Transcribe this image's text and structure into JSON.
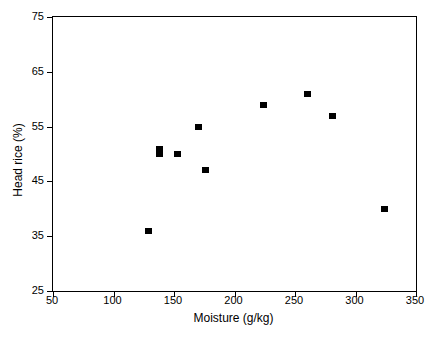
{
  "chart_data": {
    "type": "scatter",
    "title": "",
    "xlabel": "Moisture (g/kg)",
    "ylabel": "Head rice (%)",
    "xlim": [
      50,
      350
    ],
    "ylim": [
      25,
      75
    ],
    "xticks": [
      50,
      100,
      150,
      200,
      250,
      300,
      350
    ],
    "yticks": [
      25,
      35,
      45,
      55,
      65,
      75
    ],
    "xtick_labels": [
      "50",
      "100",
      "150",
      "200",
      "250",
      "300",
      "350"
    ],
    "ytick_labels": [
      "25",
      "35",
      "45",
      "55",
      "65",
      "75"
    ],
    "grid": false,
    "legend": false,
    "legend_position": "none",
    "marker": "filled-square",
    "marker_color": "#000000",
    "series": [
      {
        "name": "Head rice vs moisture",
        "points": [
          {
            "x": 129,
            "y": 36
          },
          {
            "x": 138,
            "y": 51
          },
          {
            "x": 138,
            "y": 50
          },
          {
            "x": 153,
            "y": 50
          },
          {
            "x": 170,
            "y": 55
          },
          {
            "x": 176,
            "y": 47
          },
          {
            "x": 224,
            "y": 59
          },
          {
            "x": 260,
            "y": 61
          },
          {
            "x": 281,
            "y": 57
          },
          {
            "x": 324,
            "y": 40
          }
        ]
      }
    ]
  },
  "axes": {
    "frame_color": "#000000",
    "background": "#ffffff"
  }
}
